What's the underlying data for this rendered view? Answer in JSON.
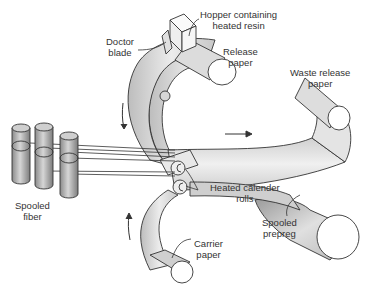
{
  "diagram": {
    "labels": {
      "hopper": [
        "Hopper containing",
        "heated resin"
      ],
      "doctor_blade": [
        "Doctor",
        "blade"
      ],
      "release_paper": [
        "Release",
        "paper"
      ],
      "waste_release_paper": [
        "Waste release",
        "paper"
      ],
      "spooled_fiber": [
        "Spooled",
        "fiber"
      ],
      "heated_calender_rolls": [
        "Heated calender",
        "rolls"
      ],
      "spooled_prepreg": [
        "Spooled",
        "prepreg"
      ],
      "carrier_paper": [
        "Carrier",
        "paper"
      ]
    },
    "colors": {
      "outline": "#333333",
      "sheet_light": "#e6e6e6",
      "sheet_dark": "#a8a8a8",
      "text": "#333333"
    }
  }
}
